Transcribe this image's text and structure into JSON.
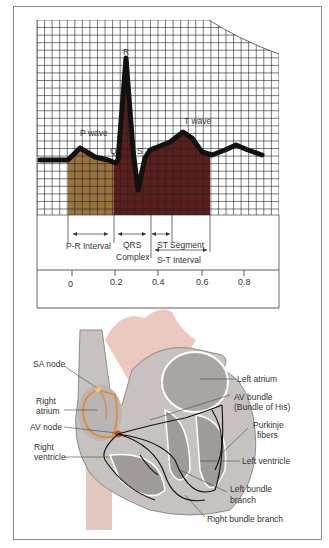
{
  "ecg": {
    "labels": {
      "p_wave": "P wave",
      "q": "Q",
      "r": "R",
      "s": "S",
      "t_wave": "T wave"
    },
    "intervals": {
      "pr": "P-R Interval",
      "qrs_line1": "QRS",
      "qrs_line2": "Complex",
      "st_segment": "ST Segment",
      "st_interval": "S-T Interval"
    },
    "axis_ticks": [
      "0",
      "0.2",
      "0.4",
      "0.6",
      "0.8"
    ],
    "colors": {
      "p_fill": "#9a7340",
      "qrs_fill": "#5a1f1c",
      "grid": "#222222",
      "trace": "#111111"
    }
  },
  "heart": {
    "labels": {
      "sa_node": "SA node",
      "right_atrium_1": "Right",
      "right_atrium_2": "atrium",
      "av_node": "AV node",
      "right_ventricle_1": "Right",
      "right_ventricle_2": "ventricle",
      "left_atrium": "Left atrium",
      "av_bundle_1": "AV bundle",
      "av_bundle_2": "(Bundle of His)",
      "purkinje_1": "Purkinje",
      "purkinje_2": "fibers",
      "left_ventricle": "Left ventricle",
      "left_bundle_1": "Left bundle",
      "left_bundle_2": "branch",
      "right_bundle": "Right bundle branch"
    },
    "colors": {
      "conduction_orange": "#e08a3a",
      "tissue_gray": "#a9a5a3",
      "vessel_pink": "#ecc9c0"
    }
  }
}
